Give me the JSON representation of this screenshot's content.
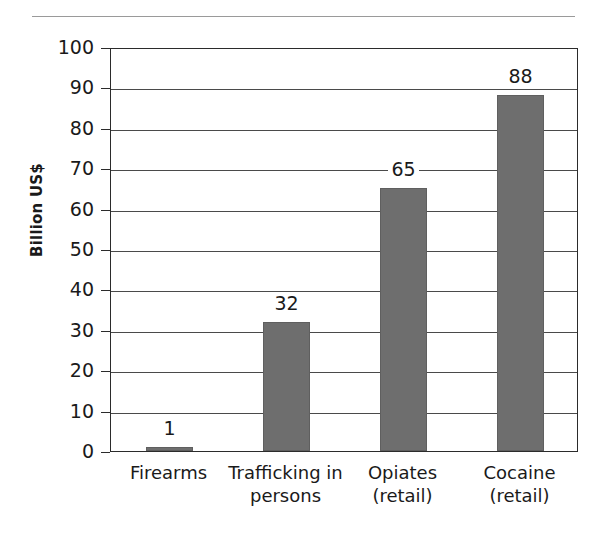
{
  "figure": {
    "top_rule": "horizontal-rule",
    "background_color": "#ffffff",
    "bar_color": "#6e6e6e",
    "axis_color": "#2b2b2b"
  },
  "chart_data": {
    "type": "bar",
    "title": "",
    "subtitle": "",
    "xlabel": "",
    "ylabel": "Billion US$",
    "categories": [
      "Firearms",
      "Trafficking in persons",
      "Opiates (retail)",
      "Cocaine (retail)"
    ],
    "category_lines": [
      [
        "Firearms"
      ],
      [
        "Trafficking in",
        "persons"
      ],
      [
        "Opiates",
        "(retail)"
      ],
      [
        "Cocaine",
        "(retail)"
      ]
    ],
    "values": [
      1,
      32,
      65,
      88
    ],
    "value_labels": [
      "1",
      "32",
      "65",
      "88"
    ],
    "ylim": [
      0,
      100
    ],
    "yticks": [
      0,
      10,
      20,
      30,
      40,
      50,
      60,
      70,
      80,
      90,
      100
    ],
    "ytick_labels": [
      "0",
      "10",
      "20",
      "30",
      "40",
      "50",
      "60",
      "70",
      "80",
      "90",
      "100"
    ],
    "grid": true,
    "grid_axis": "y",
    "legend": null,
    "legend_position": "none",
    "bar_color": "#6e6e6e",
    "units": "Billion US$"
  }
}
